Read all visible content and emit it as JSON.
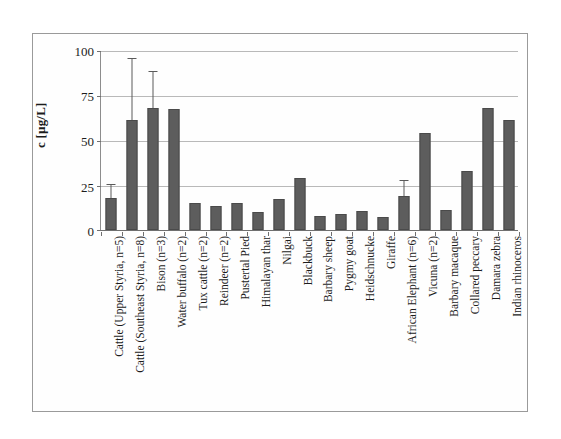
{
  "figure": {
    "y_axis_title": "c [µg/L]",
    "bar_color": "#5d5d5d",
    "gridline_color": "#b9b9b9",
    "frame_color": "#9a9a9a"
  },
  "chart_data": {
    "type": "bar",
    "title": "",
    "xlabel": "",
    "ylabel": "c [µg/L]",
    "ylim": [
      0,
      100
    ],
    "yticks": [
      0,
      25,
      50,
      75,
      100
    ],
    "ytick_labels": [
      "0",
      "25",
      "50",
      "75",
      "100"
    ],
    "grid": true,
    "legend": "none",
    "categories": [
      "Cattle (Upper Styria, n=5)",
      "Cattle (Southeast Styria, n=8)",
      "Bison (n=3)",
      "Water buffalo (n=2)",
      "Tux cattle (n=2)",
      "Reindeer (n=2)",
      "Pustertal Pied",
      "Himalayan thar",
      "Nilgai",
      "Blackbuck",
      "Barbary sheep",
      "Pygmy goat",
      "Heidschnucke",
      "Giraffe",
      "African Elephant (n=6)",
      "Vicuna (n=2)",
      "Barbary macaque",
      "Collared peccary",
      "Damara zebra",
      "Indian rhinoceros"
    ],
    "values": [
      18,
      61,
      68,
      67,
      15,
      13.5,
      15,
      10,
      17,
      29,
      8,
      9,
      10.5,
      7,
      19,
      54,
      11,
      33,
      68,
      61
    ],
    "error_upper": [
      25,
      95,
      88,
      null,
      null,
      null,
      null,
      null,
      null,
      null,
      null,
      null,
      null,
      null,
      27,
      null,
      null,
      null,
      null,
      null
    ],
    "series": [
      {
        "name": "concentration",
        "values": [
          18,
          61,
          68,
          67,
          15,
          13.5,
          15,
          10,
          17,
          29,
          8,
          9,
          10.5,
          7,
          19,
          54,
          11,
          33,
          68,
          61
        ]
      }
    ]
  }
}
